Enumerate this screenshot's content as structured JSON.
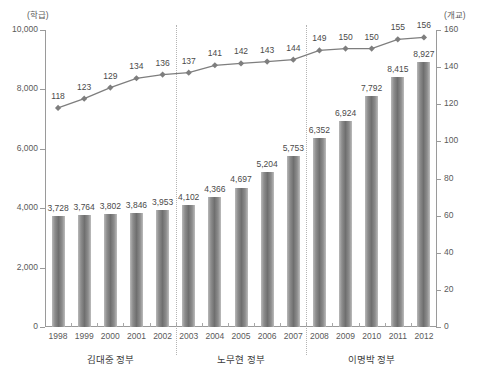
{
  "chart_data": {
    "type": "bar",
    "title": "",
    "subtitle": "",
    "xlabel": "",
    "ylabel": "(학급)",
    "y2label": "(개교)",
    "grid": false,
    "legend_position": "none",
    "categories": [
      "1998",
      "1999",
      "2000",
      "2001",
      "2002",
      "2003",
      "2004",
      "2005",
      "2006",
      "2007",
      "2008",
      "2009",
      "2010",
      "2011",
      "2012"
    ],
    "ylim": [
      0,
      10000
    ],
    "y2lim": [
      0,
      160
    ],
    "yticks": [
      "0",
      "2,000",
      "4,000",
      "6,000",
      "8,000",
      "10,000"
    ],
    "ytick_values": [
      0,
      2000,
      4000,
      6000,
      8000,
      10000
    ],
    "y2ticks": [
      "0",
      "20",
      "40",
      "60",
      "80",
      "100",
      "120",
      "140",
      "160"
    ],
    "y2tick_values": [
      0,
      20,
      40,
      60,
      80,
      100,
      120,
      140,
      160
    ],
    "series": [
      {
        "name": "학급",
        "type": "bar",
        "axis": "left",
        "color": "#6f6f6f",
        "values": [
          3728,
          3764,
          3802,
          3846,
          3953,
          4102,
          4366,
          4697,
          5204,
          5753,
          6352,
          6924,
          7792,
          8415,
          8927
        ],
        "labels": [
          "3,728",
          "3,764",
          "3,802",
          "3,846",
          "3,953",
          "4,102",
          "4,366",
          "4,697",
          "5,204",
          "5,753",
          "6,352",
          "6,924",
          "7,792",
          "8,415",
          "8,927"
        ]
      },
      {
        "name": "개교",
        "type": "line",
        "axis": "right",
        "color": "#7e7e7e",
        "marker": "diamond",
        "values": [
          118,
          123,
          129,
          134,
          136,
          137,
          141,
          142,
          143,
          144,
          149,
          150,
          150,
          155,
          156
        ],
        "labels": [
          "118",
          "123",
          "129",
          "134",
          "136",
          "137",
          "141",
          "142",
          "143",
          "144",
          "149",
          "150",
          "150",
          "155",
          "156"
        ]
      }
    ],
    "period_groups": [
      {
        "label": "김대중 정부",
        "start_index": 0,
        "end_index": 4
      },
      {
        "label": "노무현 정부",
        "start_index": 5,
        "end_index": 9
      },
      {
        "label": "이명박 정부",
        "start_index": 10,
        "end_index": 14
      }
    ],
    "dividers_after_index": [
      4,
      9
    ]
  }
}
